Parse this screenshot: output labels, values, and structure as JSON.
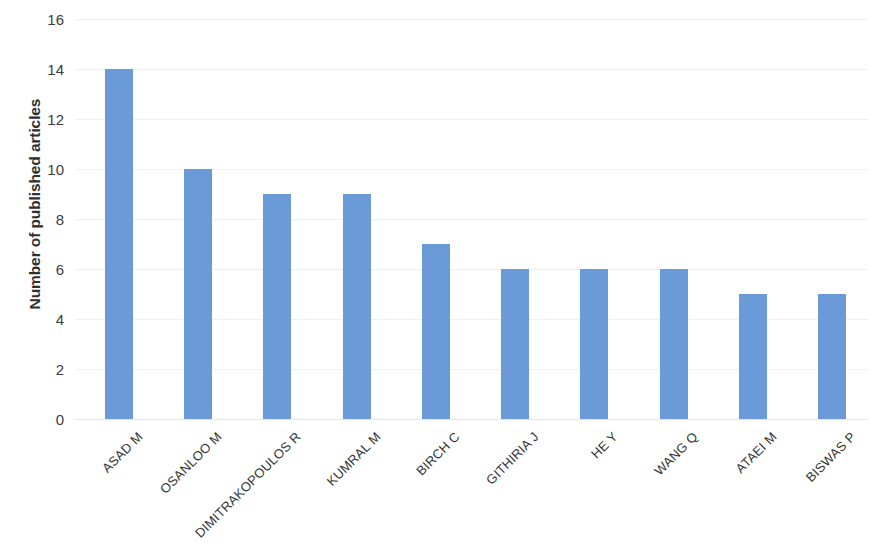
{
  "chart_data": {
    "type": "bar",
    "title": "",
    "subtitle": "",
    "xlabel": "",
    "ylabel": "Number of published articles",
    "categories": [
      "ASAD M",
      "OSANLOO M",
      "DIMITRAKOPOULOS R",
      "KUMRAL M",
      "BIRCH C",
      "GITHIRIA J",
      "HE Y",
      "WANG Q",
      "ATAEI M",
      "BISWAS P"
    ],
    "values": [
      14,
      10,
      9,
      9,
      7,
      6,
      6,
      6,
      5,
      5
    ],
    "ylim": [
      0,
      16
    ],
    "ytick_labels": [
      "16",
      "14",
      "12",
      "10",
      "8",
      "6",
      "4",
      "2",
      "0"
    ],
    "ytick_values": [
      16,
      14,
      12,
      10,
      8,
      6,
      4,
      2,
      0
    ],
    "ytick_step": 2,
    "grid": true,
    "grid_axis": "y",
    "legend": false,
    "legend_position": "none",
    "bar_color": "#6A9BD8",
    "grid_color": "#F0F0F0",
    "background_color": "#FFFFFF",
    "text_color": "#3A3A3A",
    "xtick_label_rotation": -45,
    "annotations": [],
    "data_labels": false
  }
}
